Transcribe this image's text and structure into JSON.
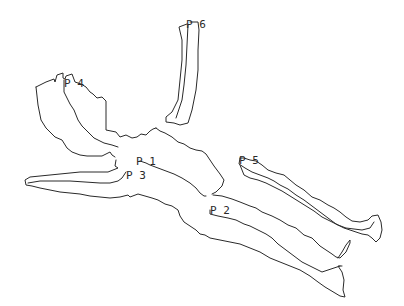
{
  "diagram": {
    "type": "cave-passage-outline-map",
    "background": "#ffffff",
    "stroke_color": "#2a2a2a",
    "labels": [
      {
        "id": "p1",
        "text": "P 1",
        "x": 136,
        "y": 156
      },
      {
        "id": "p2",
        "text": "P 2",
        "x": 210,
        "y": 205
      },
      {
        "id": "p3",
        "text": "P 3",
        "x": 126,
        "y": 170
      },
      {
        "id": "p4",
        "text": "P 4",
        "x": 64,
        "y": 78
      },
      {
        "id": "p5",
        "text": "P 5",
        "x": 239,
        "y": 155
      },
      {
        "id": "p6",
        "text": "P 6",
        "x": 186,
        "y": 19
      }
    ]
  }
}
